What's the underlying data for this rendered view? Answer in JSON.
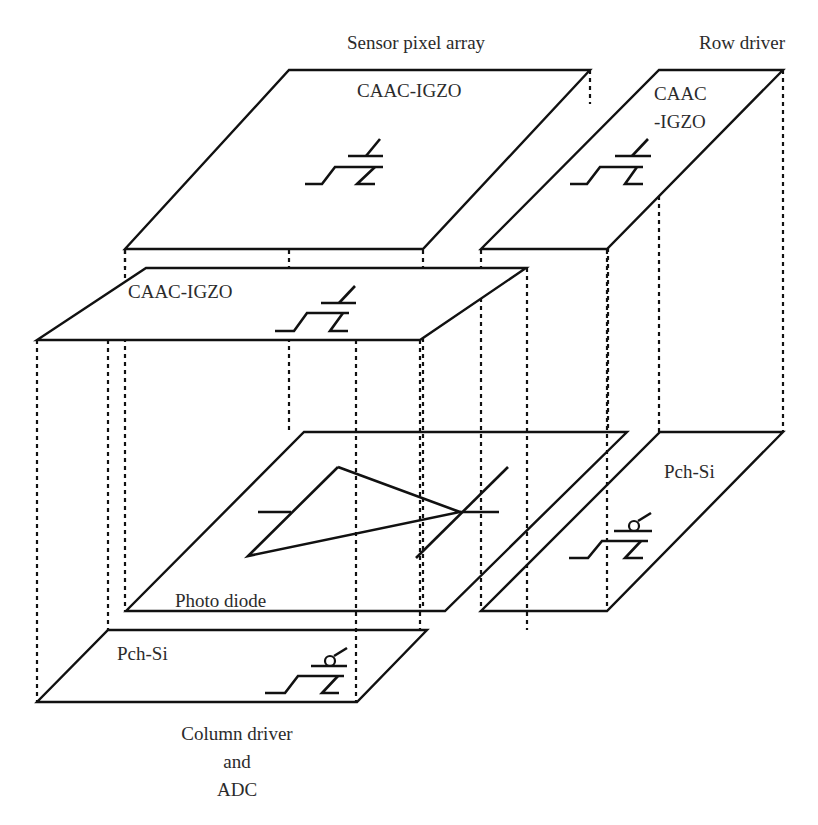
{
  "diagram": {
    "title_labels": {
      "sensor_pixel_array": "Sensor pixel array",
      "row_driver": "Row driver",
      "column_driver_line1": "Column driver",
      "column_driver_line2": "and",
      "column_driver_line3": "ADC"
    },
    "layers": {
      "sensor_top": {
        "label": "CAAC-IGZO",
        "device": "n-channel OS transistor"
      },
      "row_top": {
        "label_line1": "CAAC",
        "label_line2": "-IGZO",
        "device": "n-channel OS transistor"
      },
      "column_top": {
        "label": "CAAC-IGZO",
        "device": "n-channel OS transistor"
      },
      "sensor_bottom": {
        "label": "Photo diode",
        "device": "photodiode"
      },
      "row_bottom": {
        "label": "Pch-Si",
        "device": "p-channel Si transistor"
      },
      "column_bottom": {
        "label": "Pch-Si",
        "device": "p-channel Si transistor"
      }
    },
    "colors": {
      "line": "#111111",
      "text": "#2b2b2b",
      "background": "#ffffff"
    }
  }
}
